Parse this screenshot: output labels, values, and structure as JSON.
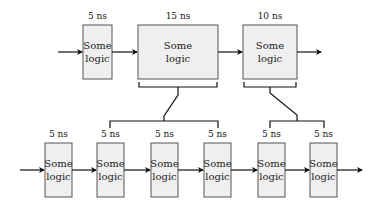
{
  "diagram": {
    "top_row": [
      {
        "delay": "5 ns",
        "line1": "Some",
        "line2": "logic"
      },
      {
        "delay": "15 ns",
        "line1": "Some",
        "line2": "logic"
      },
      {
        "delay": "10 ns",
        "line1": "Some",
        "line2": "logic"
      }
    ],
    "bottom_row": [
      {
        "delay": "5 ns",
        "line1": "Some",
        "line2": "logic"
      },
      {
        "delay": "5 ns",
        "line1": "Some",
        "line2": "logic"
      },
      {
        "delay": "5 ns",
        "line1": "Some",
        "line2": "logic"
      },
      {
        "delay": "5 ns",
        "line1": "Some",
        "line2": "logic"
      },
      {
        "delay": "5 ns",
        "line1": "Some",
        "line2": "logic"
      },
      {
        "delay": "5 ns",
        "line1": "Some",
        "line2": "logic"
      }
    ]
  }
}
